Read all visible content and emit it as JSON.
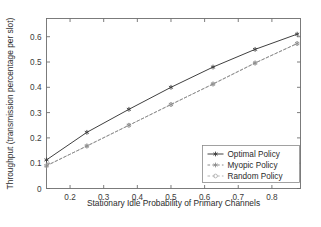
{
  "chart_data": {
    "type": "line",
    "title": "",
    "xlabel": "Stationary Idle Probability of Primary Channels",
    "ylabel": "Throughput (transmission percentage per slot)",
    "xlim": [
      0.13,
      0.885
    ],
    "ylim": [
      0,
      0.672
    ],
    "xticks": [
      0.2,
      0.3,
      0.4,
      0.5,
      0.6,
      0.7,
      0.8
    ],
    "xticklabels": [
      "0.2",
      "0.3",
      "0.4",
      "0.5",
      "0.6",
      "0.7",
      "0.8"
    ],
    "yticks": [
      0,
      0.1,
      0.2,
      0.3,
      0.4,
      0.5,
      0.6
    ],
    "yticklabels": [
      "0",
      "0.1",
      "0.2",
      "0.3",
      "0.4",
      "0.5",
      "0.6"
    ],
    "grid": false,
    "legend_position": "lower right",
    "series": [
      {
        "name": "Optimal Policy",
        "color": "#404040",
        "linestyle": "solid",
        "marker": "star",
        "x": [
          0.13,
          0.25,
          0.375,
          0.5,
          0.625,
          0.75,
          0.875
        ],
        "y": [
          0.113,
          0.222,
          0.313,
          0.4,
          0.48,
          0.55,
          0.61
        ]
      },
      {
        "name": "Myopic Policy",
        "color": "#8c8c8c",
        "linestyle": "dashed",
        "marker": "star",
        "x": [
          0.13,
          0.25,
          0.375,
          0.5,
          0.625,
          0.75,
          0.875
        ],
        "y": [
          0.09,
          0.168,
          0.25,
          0.332,
          0.413,
          0.496,
          0.573
        ]
      },
      {
        "name": "Random Policy",
        "color": "#b4b4b4",
        "linestyle": "dashed",
        "marker": "circle",
        "x": [
          0.13,
          0.25,
          0.375,
          0.5,
          0.625,
          0.75,
          0.875
        ],
        "y": [
          0.09,
          0.168,
          0.25,
          0.332,
          0.413,
          0.496,
          0.573
        ]
      }
    ],
    "legend_entries": [
      "Optimal Policy",
      "Myopic Policy",
      "Random Policy"
    ]
  }
}
